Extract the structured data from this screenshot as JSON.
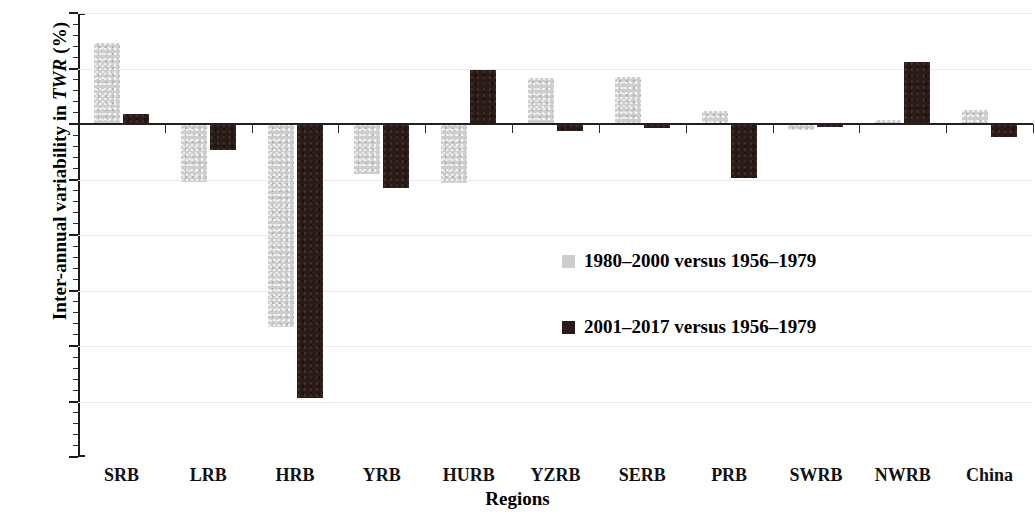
{
  "chart_data": {
    "type": "bar",
    "title": "",
    "xlabel": "Regions",
    "ylabel": "Inter-annual variability in TWR (%)",
    "ylabel_prefix": "Inter-annual variability in ",
    "ylabel_italic": "TWR",
    "ylabel_suffix": " (%)",
    "categories": [
      "SRB",
      "LRB",
      "HRB",
      "YRB",
      "HURB",
      "YZRB",
      "SERB",
      "PRB",
      "SWRB",
      "NWRB",
      "China"
    ],
    "series": [
      {
        "name": "1980–2000 versus 1956–1979",
        "color": "#cdcdcd",
        "values": [
          14.6,
          -10.4,
          -36.6,
          -9.0,
          -10.7,
          8.2,
          8.5,
          2.4,
          -1.0,
          0.8,
          2.5
        ]
      },
      {
        "name": "2001–2017 versus 1956–1979",
        "color": "#2a1b18",
        "values": [
          1.8,
          -4.6,
          -49.4,
          -11.5,
          9.7,
          -1.3,
          -0.8,
          -9.8,
          -0.6,
          11.2,
          -2.3
        ]
      }
    ],
    "ylim": [
      -60,
      20
    ],
    "ytick_labels": [
      "20",
      "10",
      "0",
      "-10",
      "-20",
      "-30",
      "-40",
      "-50",
      "-60"
    ],
    "ytick_values": [
      20,
      10,
      0,
      -10,
      -20,
      -30,
      -40,
      -50,
      -60
    ],
    "yminor_step": 2,
    "grid": "horizontal-major",
    "legend_position": "inside-center-right"
  }
}
